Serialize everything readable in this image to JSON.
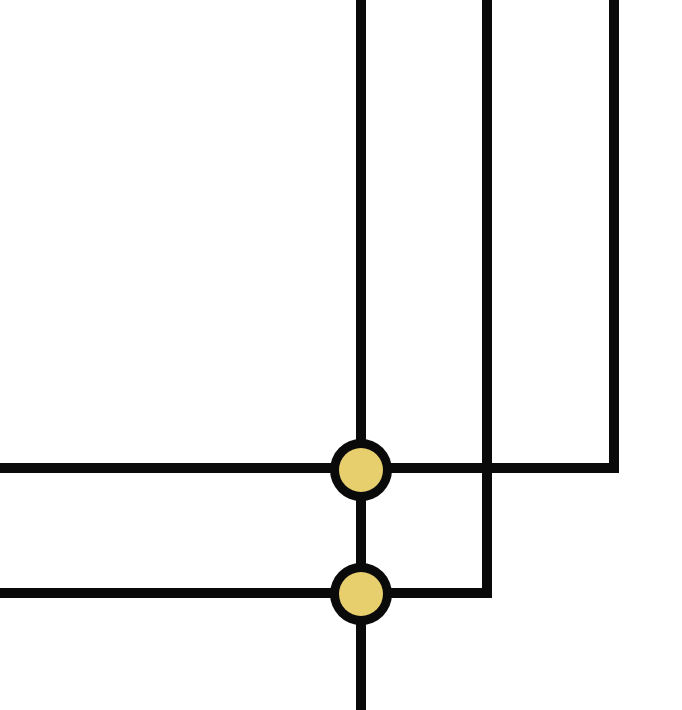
{
  "diagram": {
    "background": "#ffffff",
    "stroke_color": "#0a0a0a",
    "stroke_width": 10,
    "junction_fill": "#e8cf6e",
    "junction_stroke": "#0a0a0a",
    "vertical_lines": [
      {
        "id": "v1",
        "x": 361,
        "y1": 0,
        "y2": 710
      },
      {
        "id": "v2",
        "x": 487,
        "y1": 0,
        "y2": 593
      },
      {
        "id": "v3",
        "x": 614,
        "y1": 0,
        "y2": 468
      }
    ],
    "horizontal_lines": [
      {
        "id": "h1",
        "y": 468,
        "x1": 0,
        "x2": 614
      },
      {
        "id": "h2",
        "y": 593,
        "x1": 0,
        "x2": 487
      }
    ],
    "junctions": [
      {
        "id": "j1",
        "cx": 361,
        "cy": 470,
        "r_outer": 31,
        "r_inner": 22
      },
      {
        "id": "j2",
        "cx": 361,
        "cy": 594,
        "r_outer": 31,
        "r_inner": 22
      }
    ]
  }
}
